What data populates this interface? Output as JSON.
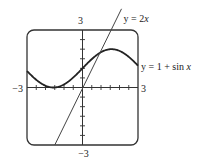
{
  "chart_data": {
    "type": "line",
    "title": "",
    "xlabel": "",
    "ylabel": "",
    "xlim": [
      -3,
      3
    ],
    "ylim": [
      -3,
      3
    ],
    "grid": false,
    "x_tick_labels": {
      "min": "−3",
      "max": "3"
    },
    "y_tick_labels": {
      "min": "−3",
      "max": "3"
    },
    "tick_step": 0.5,
    "series": [
      {
        "name": "y = 1 + sin x",
        "expr": "1 + sin(x)",
        "color": "#222222",
        "label_prefix": "y = 1 + sin ",
        "label_var": "x"
      },
      {
        "name": "y = 2x",
        "expr": "2x",
        "color": "#444444",
        "label_prefix": "y = 2",
        "label_var": "x"
      }
    ]
  }
}
